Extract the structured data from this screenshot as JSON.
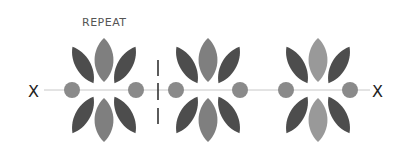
{
  "title": "REPEAT",
  "axis": {
    "left_label": "X",
    "right_label": "X"
  },
  "colors": {
    "dark_petal": "#4d4d4d",
    "mid_petal": "#7f7f7f",
    "light_petal": "#999999",
    "dot": "#8a8a8a",
    "axis_line": "#c8c8c8",
    "repeat_marker": "#333333"
  },
  "motifs": [
    {
      "name": "motif-1"
    },
    {
      "name": "motif-2"
    },
    {
      "name": "motif-3"
    }
  ]
}
